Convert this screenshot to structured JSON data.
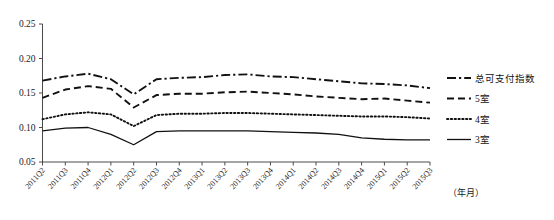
{
  "chart_data": {
    "type": "line",
    "title": "",
    "subtitle": "",
    "xlabel": "（年月）",
    "ylabel": "",
    "ylim": [
      0.05,
      0.25
    ],
    "ytick_labels": [
      "0.25",
      "0.20",
      "0.15",
      "0.10",
      "0.05"
    ],
    "ytick_values": [
      0.25,
      0.2,
      0.15,
      0.1,
      0.05
    ],
    "grid": false,
    "legend_position": "right",
    "categories": [
      "2011Q2",
      "2011Q3",
      "2011Q4",
      "2012Q1",
      "2012Q2",
      "2012Q3",
      "2012Q4",
      "2013Q1",
      "2013Q2",
      "2013Q3",
      "2013Q4",
      "2014Q1",
      "2014Q2",
      "2014Q3",
      "2014Q4",
      "2015Q1",
      "2015Q2",
      "2015Q3"
    ],
    "series": [
      {
        "name": "总可支付指数",
        "style": "dashdot",
        "values": [
          0.168,
          0.174,
          0.178,
          0.17,
          0.148,
          0.17,
          0.172,
          0.173,
          0.176,
          0.177,
          0.174,
          0.173,
          0.17,
          0.167,
          0.164,
          0.163,
          0.161,
          0.157
        ]
      },
      {
        "name": "5室",
        "style": "dashed",
        "values": [
          0.143,
          0.155,
          0.16,
          0.156,
          0.129,
          0.147,
          0.149,
          0.149,
          0.151,
          0.152,
          0.15,
          0.148,
          0.145,
          0.143,
          0.141,
          0.142,
          0.139,
          0.136
        ]
      },
      {
        "name": "4室",
        "style": "dotted",
        "values": [
          0.112,
          0.119,
          0.122,
          0.119,
          0.102,
          0.118,
          0.12,
          0.12,
          0.121,
          0.121,
          0.12,
          0.119,
          0.118,
          0.117,
          0.116,
          0.116,
          0.115,
          0.113
        ]
      },
      {
        "name": "3室",
        "style": "solid",
        "values": [
          0.095,
          0.099,
          0.1,
          0.09,
          0.075,
          0.094,
          0.095,
          0.095,
          0.095,
          0.095,
          0.094,
          0.093,
          0.092,
          0.09,
          0.085,
          0.083,
          0.082,
          0.082
        ]
      }
    ]
  },
  "legend": {
    "entries": [
      {
        "label": "总可支付指数",
        "style": "dashdot"
      },
      {
        "label": "5室",
        "style": "dashed"
      },
      {
        "label": "4室",
        "style": "dotted"
      },
      {
        "label": "3室",
        "style": "solid"
      }
    ]
  },
  "colors": {
    "line": "#111111",
    "axis": "#4a4a4a",
    "background": "#ffffff"
  }
}
